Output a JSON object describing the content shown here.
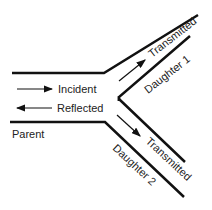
{
  "diagram": {
    "labels": {
      "incident": "Incident",
      "reflected": "Reflected",
      "parent": "Parent",
      "transmitted_top": "Transmitted",
      "transmitted_bottom": "Transmitted",
      "daughter1": "Daughter 1",
      "daughter2": "Daughter 2"
    },
    "colors": {
      "line": "#111111",
      "background": "#ffffff"
    }
  }
}
